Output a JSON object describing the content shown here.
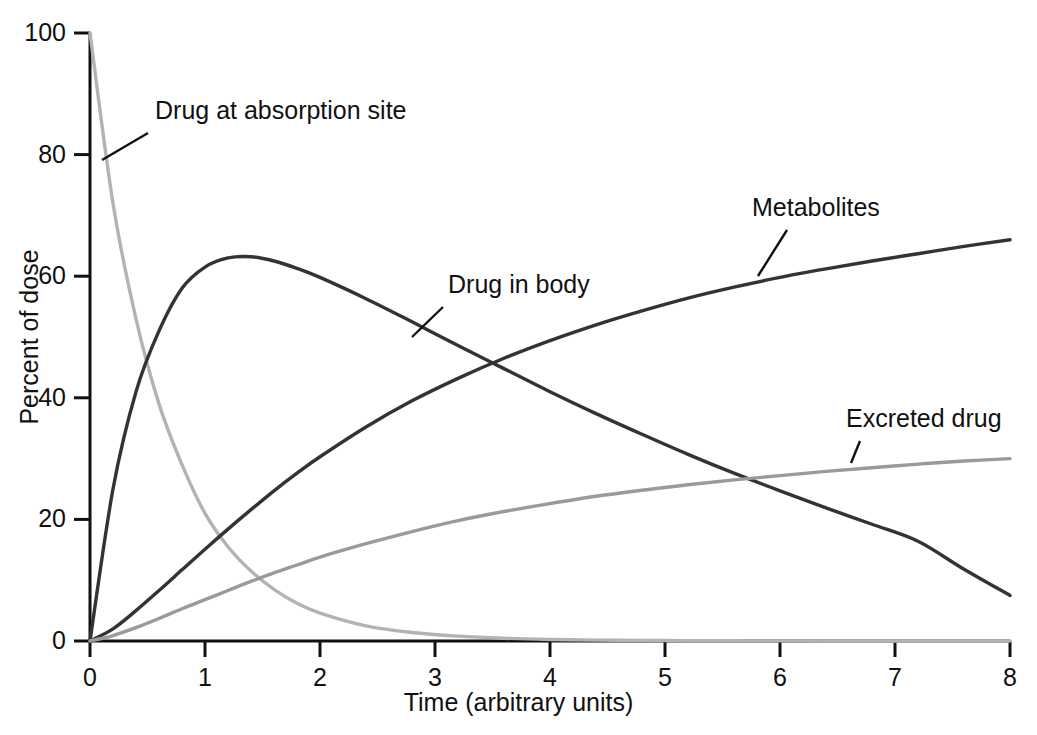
{
  "chart_data": {
    "type": "line",
    "title": "",
    "xlabel": "Time (arbitrary units)",
    "ylabel": "Percent of dose",
    "xlim": [
      0,
      8
    ],
    "ylim": [
      0,
      100
    ],
    "grid": false,
    "legend_position": "inline-annotations",
    "xticks": [
      "0",
      "1",
      "2",
      "3",
      "4",
      "5",
      "6",
      "7",
      "8"
    ],
    "yticks": [
      "0",
      "20",
      "40",
      "60",
      "80",
      "100"
    ],
    "x": [
      0,
      0.2,
      0.4,
      0.6,
      0.8,
      1.0,
      1.2,
      1.4,
      1.6,
      1.8,
      2.0,
      2.4,
      2.8,
      3.2,
      3.6,
      4.0,
      4.4,
      4.8,
      5.2,
      5.6,
      6.0,
      6.4,
      6.8,
      7.2,
      7.6,
      8.0
    ],
    "series": [
      {
        "name": "Drug at absorption site",
        "color": "#b3b3b3",
        "values": [
          100,
          72,
          53,
          39,
          29,
          21,
          15.5,
          11.5,
          8.5,
          6.2,
          4.6,
          2.5,
          1.4,
          0.8,
          0.45,
          0.25,
          0.15,
          0.1,
          0.05,
          0.03,
          0.02,
          0.01,
          0.01,
          0,
          0,
          0
        ]
      },
      {
        "name": "Drug in body",
        "color": "#333333",
        "values": [
          0,
          25,
          41,
          51,
          58,
          61.5,
          63,
          63.2,
          62.5,
          61.3,
          59.8,
          56.3,
          52.5,
          48.6,
          44.8,
          41.0,
          37.4,
          34.0,
          30.7,
          27.6,
          24.7,
          21.9,
          19.2,
          16.4,
          11.8,
          7.5
        ]
      },
      {
        "name": "Metabolites",
        "color": "#333333",
        "values": [
          0,
          2.0,
          5.0,
          8.3,
          11.7,
          15.1,
          18.4,
          21.6,
          24.7,
          27.6,
          30.3,
          35.2,
          39.5,
          43.2,
          46.5,
          49.4,
          52.0,
          54.3,
          56.4,
          58.2,
          59.8,
          61.2,
          62.5,
          63.7,
          64.9,
          66.0
        ]
      },
      {
        "name": "Excreted drug",
        "color": "#9a9a9a",
        "values": [
          0,
          0.9,
          2.2,
          3.7,
          5.3,
          6.8,
          8.3,
          9.8,
          11.2,
          12.5,
          13.8,
          16.0,
          18.0,
          19.8,
          21.3,
          22.6,
          23.8,
          24.8,
          25.7,
          26.5,
          27.2,
          27.9,
          28.5,
          29.1,
          29.6,
          30.0
        ]
      }
    ],
    "annotations": [
      {
        "text": "Drug at absorption site",
        "label_x": 155,
        "label_y": 111,
        "leader": {
          "x1": 148,
          "y1": 133,
          "x2": 102,
          "y2": 160
        }
      },
      {
        "text": "Drug in body",
        "label_x": 448,
        "label_y": 285,
        "leader": {
          "x1": 443,
          "y1": 307,
          "x2": 412,
          "y2": 337
        }
      },
      {
        "text": "Metabolites",
        "label_x": 752,
        "label_y": 208,
        "leader": {
          "x1": 787,
          "y1": 230,
          "x2": 758,
          "y2": 276
        }
      },
      {
        "text": "Excreted drug",
        "label_x": 846,
        "label_y": 419,
        "leader": {
          "x1": 860,
          "y1": 441,
          "x2": 851,
          "y2": 463
        }
      }
    ]
  }
}
